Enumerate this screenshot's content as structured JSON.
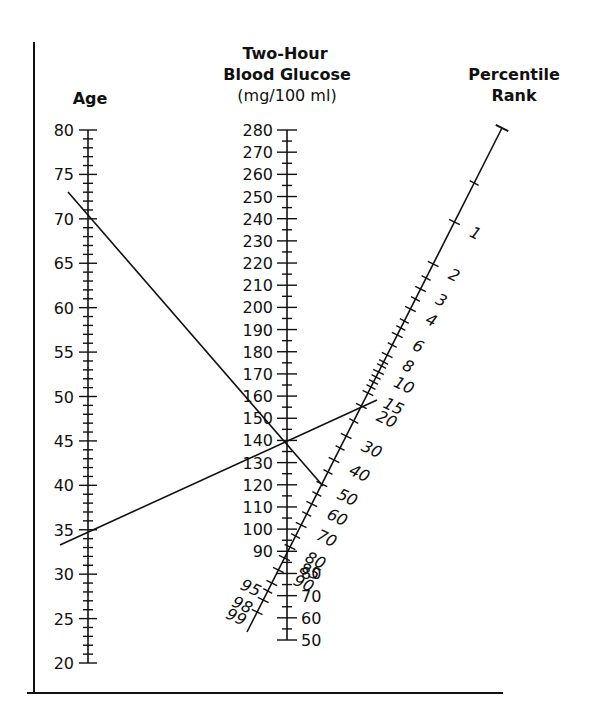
{
  "headers": {
    "age": "Age",
    "glucose_line1": "Two-Hour",
    "glucose_line2": "Blood Glucose",
    "glucose_units": "(mg/100 ml)",
    "percentile_line1": "Percentile",
    "percentile_line2": "Rank"
  },
  "age_axis": {
    "min": 20,
    "max": 80,
    "major_step": 5,
    "minor_step": 1,
    "labels": [
      "80",
      "75",
      "70",
      "65",
      "60",
      "55",
      "50",
      "45",
      "40",
      "35",
      "30",
      "25",
      "20"
    ]
  },
  "glucose_axis": {
    "min": 50,
    "max": 280,
    "major_step": 10,
    "minor_step": 5,
    "labels_left": [
      "280",
      "270",
      "260",
      "250",
      "240",
      "230",
      "220",
      "210",
      "200",
      "190",
      "180",
      "170",
      "160",
      "150",
      "140",
      "130",
      "120",
      "110",
      "100",
      "90"
    ],
    "labels_right": [
      "80",
      "70",
      "60",
      "50"
    ]
  },
  "percentile_axis": {
    "labels": [
      "1",
      "2",
      "3",
      "4",
      "6",
      "8",
      "10",
      "15",
      "20",
      "30",
      "40",
      "50",
      "60",
      "70",
      "80",
      "85",
      "90",
      "95",
      "98",
      "99"
    ]
  },
  "example_lines": [
    {
      "age": 70,
      "glucose": 140,
      "percentile": 50
    },
    {
      "age": 35,
      "glucose": 140,
      "percentile": 18
    }
  ],
  "chart_data": {
    "type": "nomogram",
    "axes": [
      {
        "name": "Age",
        "range": [
          20,
          80
        ],
        "ticks_major": [
          20,
          25,
          30,
          35,
          40,
          45,
          50,
          55,
          60,
          65,
          70,
          75,
          80
        ]
      },
      {
        "name": "Two-Hour Blood Glucose (mg/100 ml)",
        "range": [
          50,
          280
        ],
        "ticks_major": [
          50,
          60,
          70,
          80,
          90,
          100,
          110,
          120,
          130,
          140,
          150,
          160,
          170,
          180,
          190,
          200,
          210,
          220,
          230,
          240,
          250,
          260,
          270,
          280
        ]
      },
      {
        "name": "Percentile Rank",
        "ticks_labeled": [
          1,
          2,
          3,
          4,
          6,
          8,
          10,
          15,
          20,
          30,
          40,
          50,
          60,
          70,
          80,
          85,
          90,
          95,
          98,
          99
        ]
      }
    ],
    "examples": [
      {
        "age": 70,
        "glucose": 140,
        "percentile": 50
      },
      {
        "age": 35,
        "glucose": 140,
        "percentile": 18
      }
    ]
  }
}
